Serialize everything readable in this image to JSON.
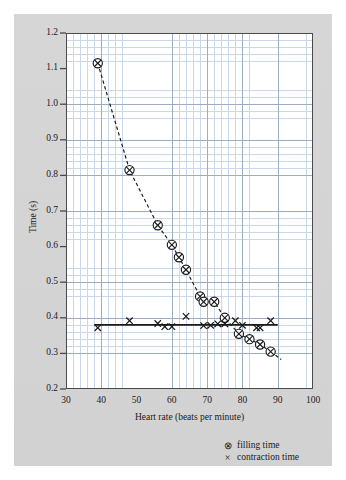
{
  "chart_data": {
    "type": "scatter",
    "title": "",
    "xlabel": "Heart rate (beats per minute)",
    "ylabel": "Time (s)",
    "xlim": [
      30,
      100
    ],
    "ylim": [
      0.2,
      1.2
    ],
    "xticks": [
      "30",
      "40",
      "50",
      "60",
      "70",
      "80",
      "90",
      "100"
    ],
    "yticks": [
      "0.2",
      "0.3",
      "0.4",
      "0.5",
      "0.6",
      "0.7",
      "0.8",
      "0.9",
      "1.0",
      "1.1",
      "1.2"
    ],
    "grid": "graph paper: minor grid every 2 bpm / 0.02 s, major grid every 10 bpm / 0.1 s",
    "legend_position": "below axes, right",
    "series": [
      {
        "name": "filling time",
        "marker": "circle-with-cross",
        "line": "dashed",
        "points": [
          {
            "x": 39,
            "y": 1.115
          },
          {
            "x": 48,
            "y": 0.815
          },
          {
            "x": 56,
            "y": 0.66
          },
          {
            "x": 60,
            "y": 0.605
          },
          {
            "x": 62,
            "y": 0.57
          },
          {
            "x": 64,
            "y": 0.535
          },
          {
            "x": 68,
            "y": 0.46
          },
          {
            "x": 69,
            "y": 0.445
          },
          {
            "x": 72,
            "y": 0.445
          },
          {
            "x": 75,
            "y": 0.4
          },
          {
            "x": 79,
            "y": 0.355
          },
          {
            "x": 82,
            "y": 0.34
          },
          {
            "x": 85,
            "y": 0.325
          },
          {
            "x": 88,
            "y": 0.305
          }
        ]
      },
      {
        "name": "contraction time",
        "marker": "cross",
        "line": "solid horizontal",
        "line_value": 0.38,
        "line_from_x": 38,
        "line_to_x": 90,
        "points": [
          {
            "x": 39,
            "y": 0.372
          },
          {
            "x": 48,
            "y": 0.392
          },
          {
            "x": 56,
            "y": 0.384
          },
          {
            "x": 58,
            "y": 0.375
          },
          {
            "x": 60,
            "y": 0.375
          },
          {
            "x": 64,
            "y": 0.404
          },
          {
            "x": 69,
            "y": 0.378
          },
          {
            "x": 71,
            "y": 0.379
          },
          {
            "x": 73,
            "y": 0.383
          },
          {
            "x": 75,
            "y": 0.383
          },
          {
            "x": 78,
            "y": 0.392
          },
          {
            "x": 80,
            "y": 0.379
          },
          {
            "x": 84,
            "y": 0.372
          },
          {
            "x": 85,
            "y": 0.372
          },
          {
            "x": 88,
            "y": 0.392
          }
        ]
      }
    ],
    "legend": [
      {
        "marker": "circle-with-cross",
        "label": "filling time"
      },
      {
        "marker": "cross",
        "label": "contraction time"
      }
    ]
  },
  "colors": {
    "background": "#ffffff",
    "card": "#d4d4d4",
    "plot_background": "#ffffff",
    "grid_minor": "#c9d8ea",
    "grid_major": "#9badc2",
    "axis": "#4a4a4a",
    "marker": "#1a1a1a",
    "text": "#1a1a1a"
  }
}
